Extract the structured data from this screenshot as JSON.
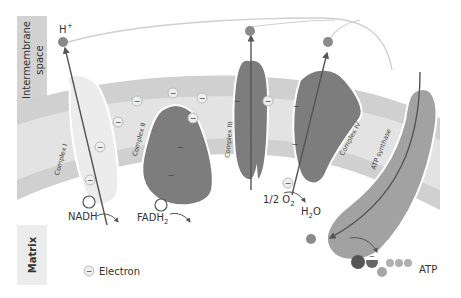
{
  "regions": {
    "intermembrane": "Intermembrane space",
    "intermembrane_line1": "Intermembrane",
    "intermembrane_line2": "space",
    "matrix": "Matrix"
  },
  "ions": {
    "proton": "H",
    "proton_sup": "+"
  },
  "complexes": [
    {
      "id": "complex-1",
      "label": "Complex I"
    },
    {
      "id": "complex-2",
      "label": "Complex II"
    },
    {
      "id": "complex-3",
      "label": "Complex III"
    },
    {
      "id": "complex-4",
      "label": "Complex IV"
    },
    {
      "id": "atp-synthase",
      "label": "ATP synthase"
    }
  ],
  "substrates": {
    "nadh": "NADH",
    "fadh2_main": "FADH",
    "fadh2_sub": "2",
    "oxygen_main": "1/2 O",
    "oxygen_sub": "2",
    "water_h": "H",
    "water_sub": "2",
    "water_o": "O",
    "atp": "ATP"
  },
  "legend": {
    "electron_symbol": "−",
    "electron_label": "Electron"
  },
  "colors": {
    "membrane_outer": "#c8c8c8",
    "membrane_inner": "#e0e0e0",
    "side_label_bg": "#d2d2d2",
    "complex1": "#ebebeb",
    "complex_dark": "#7a7a7a",
    "atp_synthase": "#a0a0a0",
    "proton": "#8a8a8a",
    "arrow": "#555555"
  }
}
